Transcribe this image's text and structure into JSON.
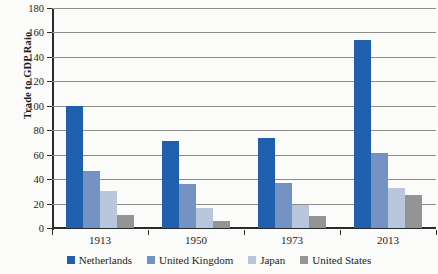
{
  "chart_data": {
    "type": "bar",
    "title": "",
    "xlabel": "",
    "ylabel": "Trade to GDP Raio",
    "categories": [
      "1913",
      "1950",
      "1973",
      "2013"
    ],
    "series": [
      {
        "name": "Netherlands",
        "color": "#1f5fae",
        "values": [
          100,
          71,
          74,
          154
        ]
      },
      {
        "name": "United Kingdom",
        "color": "#7392c4",
        "values": [
          47,
          36,
          37,
          61
        ]
      },
      {
        "name": "Japan",
        "color": "#b9c7dd",
        "values": [
          30,
          16,
          19,
          33
        ]
      },
      {
        "name": "United States",
        "color": "#949494",
        "values": [
          11,
          6,
          10,
          27
        ]
      }
    ],
    "ylim": [
      0,
      180
    ],
    "yticks": [
      0,
      20,
      40,
      60,
      80,
      100,
      120,
      140,
      160,
      180
    ],
    "ytick_labels": [
      "0",
      "20",
      "40",
      "60",
      "80",
      "100",
      "120",
      "140",
      "160",
      "180"
    ],
    "grid": true,
    "legend_position": "bottom"
  }
}
